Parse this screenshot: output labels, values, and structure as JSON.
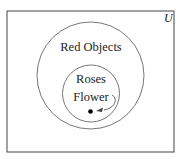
{
  "diagram": {
    "type": "venn",
    "universe_label": "U",
    "sets": [
      {
        "label": "Red Objects",
        "contains": "Roses"
      },
      {
        "label": "Roses"
      }
    ],
    "element": {
      "label": "Flower",
      "in_set": "Roses"
    },
    "colors": {
      "stroke": "#555555",
      "border": "#444444",
      "dot": "#000000",
      "background": "#ffffff"
    }
  }
}
